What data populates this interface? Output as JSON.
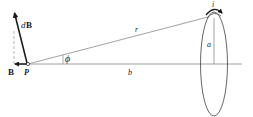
{
  "diagram": {
    "labels": {
      "dB_d": "d",
      "dB_B": "B",
      "B": "B",
      "P": "P",
      "phi": "ϕ",
      "r": "r",
      "b": "b",
      "a": "a",
      "i": "i"
    },
    "colors": {
      "line": "#8a8a8a",
      "vector": "#1a1a1a",
      "background": "#ffffff"
    }
  }
}
